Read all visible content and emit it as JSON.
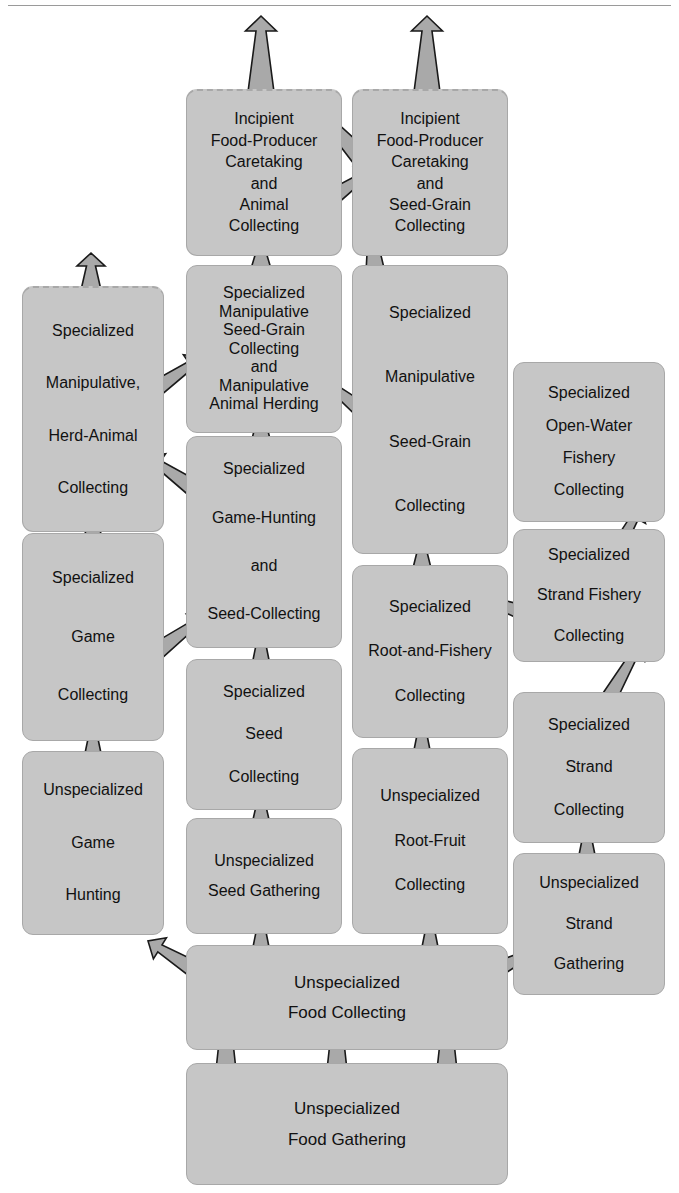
{
  "diagram": {
    "colors": {
      "box_fill": "#c6c6c6",
      "box_border": "#a8a8a8",
      "arrow_fill": "#a9a9a9",
      "arrow_stroke": "#1a1a1a",
      "text": "#111111",
      "rule": "#9a9a9a"
    },
    "nodes": [
      {
        "id": "incipient-animal",
        "name": "incipient-food-producer-animal-collecting",
        "lines": [
          "Incipient",
          "Food-Producer",
          "Caretaking",
          "and",
          "Animal",
          "Collecting"
        ],
        "dashed_top": true,
        "x": 186,
        "y": 89,
        "w": 156,
        "h": 167,
        "font_size": 16,
        "line_gap": 5,
        "align": "center"
      },
      {
        "id": "incipient-seedgrain",
        "name": "incipient-food-producer-seed-grain-collecting",
        "lines": [
          "Incipient",
          "Food-Producer",
          "Caretaking",
          "and",
          "Seed-Grain",
          "Collecting"
        ],
        "dashed_top": true,
        "x": 352,
        "y": 89,
        "w": 156,
        "h": 167,
        "font_size": 16,
        "line_gap": 5,
        "align": "center"
      },
      {
        "id": "spec-manip-herd-animal",
        "name": "specialized-manipulative-herd-animal-collecting",
        "lines": [
          "Specialized",
          "Manipulative,",
          "Herd-Animal",
          "Collecting"
        ],
        "dashed_top": true,
        "x": 22,
        "y": 286,
        "w": 142,
        "h": 246,
        "font_size": 16,
        "line_gap": 36,
        "align": "center"
      },
      {
        "id": "spec-manip-seedgrain-animal-herding",
        "name": "specialized-manipulative-seed-grain-collecting-and-animal-herding",
        "lines": [
          "Specialized",
          "Manipulative",
          "Seed-Grain",
          "Collecting",
          "and",
          "Manipulative",
          "Animal Herding"
        ],
        "dashed_top": false,
        "x": 186,
        "y": 265,
        "w": 156,
        "h": 168,
        "font_size": 16,
        "line_gap": 2,
        "align": "center"
      },
      {
        "id": "spec-manip-seedgrain",
        "name": "specialized-manipulative-seed-grain-collecting",
        "lines": [
          "Specialized",
          "Manipulative",
          "Seed-Grain",
          "Collecting"
        ],
        "dashed_top": false,
        "x": 352,
        "y": 265,
        "w": 156,
        "h": 289,
        "font_size": 16,
        "line_gap": 48,
        "align": "center"
      },
      {
        "id": "spec-openwater-fishery",
        "name": "specialized-open-water-fishery-collecting",
        "lines": [
          "Specialized",
          "Open-Water",
          "Fishery",
          "Collecting"
        ],
        "dashed_top": false,
        "x": 513,
        "y": 362,
        "w": 152,
        "h": 160,
        "font_size": 16,
        "line_gap": 16,
        "align": "center"
      },
      {
        "id": "spec-strand-fishery",
        "name": "specialized-strand-fishery-collecting",
        "lines": [
          "Specialized",
          "Strand  Fishery",
          "Collecting"
        ],
        "dashed_top": false,
        "x": 513,
        "y": 529,
        "w": 152,
        "h": 133,
        "font_size": 16,
        "line_gap": 24,
        "align": "center"
      },
      {
        "id": "spec-game-collecting",
        "name": "specialized-game-collecting",
        "lines": [
          "Specialized",
          "Game",
          "Collecting"
        ],
        "dashed_top": false,
        "x": 22,
        "y": 533,
        "w": 142,
        "h": 208,
        "font_size": 16,
        "line_gap": 42,
        "align": "center"
      },
      {
        "id": "spec-gamehunt-seedcollect",
        "name": "specialized-game-hunting-and-seed-collecting",
        "lines": [
          "Specialized",
          "Game-Hunting",
          "and",
          "Seed-Collecting"
        ],
        "dashed_top": false,
        "x": 186,
        "y": 436,
        "w": 156,
        "h": 212,
        "font_size": 16,
        "line_gap": 32,
        "align": "center"
      },
      {
        "id": "spec-seed-collecting",
        "name": "specialized-seed-collecting",
        "lines": [
          "Specialized",
          "Seed",
          "Collecting"
        ],
        "dashed_top": false,
        "x": 186,
        "y": 659,
        "w": 156,
        "h": 151,
        "font_size": 16,
        "line_gap": 26,
        "align": "center"
      },
      {
        "id": "spec-root-fishery",
        "name": "specialized-root-and-fishery-collecting",
        "lines": [
          "Specialized",
          "Root-and-Fishery",
          "Collecting"
        ],
        "dashed_top": false,
        "x": 352,
        "y": 565,
        "w": 156,
        "h": 173,
        "font_size": 16,
        "line_gap": 28,
        "align": "center"
      },
      {
        "id": "spec-strand-collecting",
        "name": "specialized-strand-collecting",
        "lines": [
          "Specialized",
          "Strand",
          "Collecting"
        ],
        "dashed_top": false,
        "x": 513,
        "y": 692,
        "w": 152,
        "h": 151,
        "font_size": 16,
        "line_gap": 26,
        "align": "center"
      },
      {
        "id": "unspec-game-hunting",
        "name": "unspecialized-game-hunting",
        "lines": [
          "Unspecialized",
          "Game",
          "Hunting"
        ],
        "dashed_top": false,
        "x": 22,
        "y": 751,
        "w": 142,
        "h": 184,
        "font_size": 16,
        "line_gap": 36,
        "align": "center"
      },
      {
        "id": "unspec-seed-gathering",
        "name": "unspecialized-seed-gathering",
        "lines": [
          "Unspecialized",
          "Seed  Gathering"
        ],
        "dashed_top": false,
        "x": 186,
        "y": 818,
        "w": 156,
        "h": 116,
        "font_size": 16,
        "line_gap": 14,
        "align": "center"
      },
      {
        "id": "unspec-root-fruit",
        "name": "unspecialized-root-fruit-collecting",
        "lines": [
          "Unspecialized",
          "Root-Fruit",
          "Collecting"
        ],
        "dashed_top": false,
        "x": 352,
        "y": 748,
        "w": 156,
        "h": 186,
        "font_size": 16,
        "line_gap": 28,
        "align": "center"
      },
      {
        "id": "unspec-strand-gathering",
        "name": "unspecialized-strand-gathering",
        "lines": [
          "Unspecialized",
          "Strand",
          "Gathering"
        ],
        "dashed_top": false,
        "x": 513,
        "y": 853,
        "w": 152,
        "h": 142,
        "font_size": 16,
        "line_gap": 24,
        "align": "center"
      },
      {
        "id": "unspec-food-collecting",
        "name": "unspecialized-food-collecting",
        "lines": [
          "Unspecialized",
          "Food Collecting"
        ],
        "dashed_top": false,
        "x": 186,
        "y": 945,
        "w": 322,
        "h": 105,
        "font_size": 17,
        "line_gap": 13,
        "align": "center"
      },
      {
        "id": "unspec-food-gathering",
        "name": "unspecialized-food-gathering",
        "lines": [
          "Unspecialized",
          "Food  Gathering"
        ],
        "dashed_top": false,
        "x": 186,
        "y": 1063,
        "w": 322,
        "h": 122,
        "font_size": 17,
        "line_gap": 13,
        "align": "center"
      }
    ],
    "arrows": [
      {
        "name": "arrow-to-top-left-offpage",
        "from": "incipient-animal",
        "to": "off-page-top",
        "type": "straight",
        "x1": 261,
        "y1": 92,
        "x2": 261,
        "y2": 16,
        "w1": 26,
        "w2": 10,
        "head": 15
      },
      {
        "name": "arrow-to-top-right-offpage",
        "from": "incipient-seedgrain",
        "to": "off-page-top",
        "type": "straight",
        "x1": 427,
        "y1": 92,
        "x2": 427,
        "y2": 16,
        "w1": 26,
        "w2": 10,
        "head": 15
      },
      {
        "name": "arrow-herd-animal-to-offpage",
        "from": "spec-manip-herd-animal",
        "to": "off-page-top",
        "type": "straight",
        "x1": 91,
        "y1": 290,
        "x2": 91,
        "y2": 253,
        "w1": 20,
        "w2": 9,
        "head": 13
      },
      {
        "name": "arrow-seedgrain-animal-to-incipient-animal",
        "from": "spec-manip-seedgrain-animal-herding",
        "to": "incipient-animal",
        "type": "straight",
        "x1": 261,
        "y1": 272,
        "x2": 261,
        "y2": 238,
        "w1": 22,
        "w2": 10,
        "head": 14
      },
      {
        "name": "arrow-seedgrain-to-incipient-seedgrain",
        "from": "spec-manip-seedgrain",
        "to": "incipient-seedgrain",
        "type": "straight",
        "x1": 377,
        "y1": 290,
        "x2": 371,
        "y2": 224,
        "w1": 24,
        "w2": 9,
        "head": 14
      },
      {
        "name": "arrow-incipient-seedgrain-to-incipient-animal",
        "from": "incipient-seedgrain",
        "to": "incipient-animal",
        "type": "diagonal",
        "x1": 365,
        "y1": 162,
        "x2": 310,
        "y2": 102,
        "w1": 20,
        "w2": 8,
        "head": 14
      },
      {
        "name": "arrow-incipient-animal-to-incipient-seedgrain",
        "from": "incipient-animal",
        "to": "incipient-seedgrain",
        "type": "diagonal",
        "x1": 320,
        "y1": 206,
        "x2": 372,
        "y2": 170,
        "w1": 20,
        "w2": 8,
        "head": 14
      },
      {
        "name": "arrow-herd-animal-to-seedgrain-animal",
        "from": "spec-manip-herd-animal",
        "to": "spec-manip-seedgrain-animal-herding",
        "type": "diagonal",
        "x1": 140,
        "y1": 400,
        "x2": 202,
        "y2": 357,
        "w1": 20,
        "w2": 8,
        "head": 14
      },
      {
        "name": "arrow-seedgrain-to-seedgrain-animal",
        "from": "spec-manip-seedgrain",
        "to": "spec-manip-seedgrain-animal-herding",
        "type": "diagonal",
        "x1": 380,
        "y1": 425,
        "x2": 321,
        "y2": 378,
        "w1": 20,
        "w2": 8,
        "head": 14
      },
      {
        "name": "arrow-gamehunt-to-seedgrain-animal",
        "from": "spec-gamehunt-seedcollect",
        "to": "spec-manip-seedgrain-animal-herding",
        "type": "straight",
        "x1": 261,
        "y1": 443,
        "x2": 261,
        "y2": 408,
        "w1": 20,
        "w2": 9,
        "head": 13
      },
      {
        "name": "arrow-gamehunt-to-herd-animal",
        "from": "spec-gamehunt-seedcollect",
        "to": "spec-manip-herd-animal",
        "type": "diagonal",
        "x1": 206,
        "y1": 497,
        "x2": 147,
        "y2": 456,
        "w1": 20,
        "w2": 8,
        "head": 14
      },
      {
        "name": "arrow-game-collecting-to-gamehunt",
        "from": "spec-game-collecting",
        "to": "spec-gamehunt-seedcollect",
        "type": "diagonal",
        "x1": 145,
        "y1": 660,
        "x2": 205,
        "y2": 616,
        "w1": 20,
        "w2": 8,
        "head": 14
      },
      {
        "name": "arrow-game-collecting-up",
        "from": "spec-game-collecting",
        "to": "spec-manip-herd-animal",
        "type": "straight",
        "x1": 93,
        "y1": 538,
        "x2": 93,
        "y2": 506,
        "w1": 18,
        "w2": 8,
        "head": 12
      },
      {
        "name": "arrow-unspec-game-to-game-collecting",
        "from": "unspec-game-hunting",
        "to": "spec-game-collecting",
        "type": "straight",
        "x1": 93,
        "y1": 758,
        "x2": 93,
        "y2": 722,
        "w1": 18,
        "w2": 8,
        "head": 12
      },
      {
        "name": "arrow-seed-collecting-to-gamehunt",
        "from": "spec-seed-collecting",
        "to": "spec-gamehunt-seedcollect",
        "type": "straight",
        "x1": 261,
        "y1": 665,
        "x2": 261,
        "y2": 628,
        "w1": 18,
        "w2": 8,
        "head": 12
      },
      {
        "name": "arrow-unspec-seed-to-seed-collecting",
        "from": "unspec-seed-gathering",
        "to": "spec-seed-collecting",
        "type": "straight",
        "x1": 261,
        "y1": 824,
        "x2": 261,
        "y2": 790,
        "w1": 18,
        "w2": 8,
        "head": 12
      },
      {
        "name": "arrow-root-fishery-to-seedgrain",
        "from": "spec-root-fishery",
        "to": "spec-manip-seedgrain",
        "type": "straight",
        "x1": 422,
        "y1": 572,
        "x2": 422,
        "y2": 537,
        "w1": 20,
        "w2": 9,
        "head": 13
      },
      {
        "name": "arrow-unspec-root-to-root-fishery",
        "from": "unspec-root-fruit",
        "to": "spec-root-fishery",
        "type": "straight",
        "x1": 422,
        "y1": 755,
        "x2": 422,
        "y2": 718,
        "w1": 18,
        "w2": 8,
        "head": 12
      },
      {
        "name": "arrow-strand-fishery-to-root-fishery",
        "from": "spec-strand-fishery",
        "to": "spec-root-fishery",
        "type": "diagonal",
        "x1": 536,
        "y1": 617,
        "x2": 478,
        "y2": 597,
        "w1": 18,
        "w2": 8,
        "head": 13
      },
      {
        "name": "arrow-strand-fishery-to-openwater",
        "from": "spec-strand-fishery",
        "to": "spec-openwater-fishery",
        "type": "diagonal",
        "x1": 598,
        "y1": 583,
        "x2": 641,
        "y2": 506,
        "w1": 18,
        "w2": 8,
        "head": 13
      },
      {
        "name": "arrow-strand-collecting-to-strand-fishery",
        "from": "spec-strand-collecting",
        "to": "spec-strand-fishery",
        "type": "diagonal",
        "x1": 601,
        "y1": 712,
        "x2": 640,
        "y2": 644,
        "w1": 18,
        "w2": 8,
        "head": 13
      },
      {
        "name": "arrow-unspec-strand-to-strand-collecting",
        "from": "unspec-strand-gathering",
        "to": "spec-strand-collecting",
        "type": "straight",
        "x1": 587,
        "y1": 860,
        "x2": 587,
        "y2": 823,
        "w1": 18,
        "w2": 8,
        "head": 12
      },
      {
        "name": "arrow-food-collecting-to-unspec-game",
        "from": "unspec-food-collecting",
        "to": "unspec-game-hunting",
        "type": "diagonal",
        "x1": 208,
        "y1": 978,
        "x2": 148,
        "y2": 941,
        "w1": 20,
        "w2": 8,
        "head": 14
      },
      {
        "name": "arrow-food-collecting-to-unspec-strand",
        "from": "unspec-food-collecting",
        "to": "unspec-strand-gathering",
        "type": "diagonal",
        "x1": 478,
        "y1": 979,
        "x2": 540,
        "y2": 948,
        "w1": 20,
        "w2": 8,
        "head": 14
      },
      {
        "name": "arrow-food-collecting-to-unspec-seed",
        "from": "unspec-food-collecting",
        "to": "unspec-seed-gathering",
        "type": "straight",
        "x1": 261,
        "y1": 952,
        "x2": 261,
        "y2": 915,
        "w1": 18,
        "w2": 8,
        "head": 12
      },
      {
        "name": "arrow-food-collecting-to-unspec-root",
        "from": "unspec-food-collecting",
        "to": "unspec-root-fruit",
        "type": "straight",
        "x1": 430,
        "y1": 952,
        "x2": 430,
        "y2": 915,
        "w1": 18,
        "w2": 8,
        "head": 12
      },
      {
        "name": "arrow-food-gathering-to-collecting-left",
        "from": "unspec-food-gathering",
        "to": "unspec-food-collecting",
        "type": "straight",
        "x1": 226,
        "y1": 1070,
        "x2": 226,
        "y2": 1006,
        "w1": 20,
        "w2": 9,
        "head": 13
      },
      {
        "name": "arrow-food-gathering-to-collecting-mid",
        "from": "unspec-food-gathering",
        "to": "unspec-food-collecting",
        "type": "straight",
        "x1": 337,
        "y1": 1070,
        "x2": 337,
        "y2": 1006,
        "w1": 20,
        "w2": 9,
        "head": 13
      },
      {
        "name": "arrow-food-gathering-to-collecting-right",
        "from": "unspec-food-gathering",
        "to": "unspec-food-collecting",
        "type": "straight",
        "x1": 447,
        "y1": 1070,
        "x2": 447,
        "y2": 1006,
        "w1": 20,
        "w2": 9,
        "head": 13
      }
    ]
  }
}
